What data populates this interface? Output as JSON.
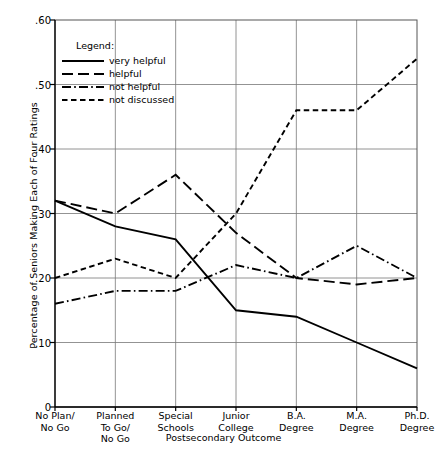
{
  "chart_data": {
    "type": "line",
    "title": "",
    "xlabel": "Postsecondary Outcome",
    "ylabel": "Percentage of Seniors Making Each of Four Ratings",
    "categories": [
      "No Plan/\nNo Go",
      "Planned\nTo Go/\nNo Go",
      "Special\nSchools",
      "Junior\nCollege",
      "B.A.\nDegree",
      "M.A.\nDegree",
      "Ph.D.\nDegree"
    ],
    "ylim": [
      0,
      0.6
    ],
    "ytick_values": [
      0,
      0.1,
      0.2,
      0.3,
      0.4,
      0.5,
      0.6
    ],
    "ytick_labels": [
      "0",
      ".10",
      ".20",
      ".30",
      ".40",
      ".50",
      ".60"
    ],
    "grid": true,
    "legend_position": "upper-left-inside",
    "legend_title": "Legend:",
    "series": [
      {
        "name": "very helpful",
        "style": "solid",
        "color": "#000000",
        "values": [
          0.32,
          0.28,
          0.26,
          0.15,
          0.14,
          0.1,
          0.06
        ]
      },
      {
        "name": "helpful",
        "style": "long-dash",
        "color": "#000000",
        "values": [
          0.32,
          0.3,
          0.36,
          0.27,
          0.2,
          0.19,
          0.2
        ]
      },
      {
        "name": "not helpful",
        "style": "dash-dot",
        "color": "#000000",
        "values": [
          0.16,
          0.18,
          0.18,
          0.22,
          0.2,
          0.25,
          0.2
        ]
      },
      {
        "name": "not discussed",
        "style": "short-dash",
        "color": "#000000",
        "values": [
          0.2,
          0.23,
          0.2,
          0.3,
          0.46,
          0.46,
          0.54
        ]
      }
    ]
  },
  "xticks": [
    {
      "lines": [
        "No Plan/",
        "No Go"
      ]
    },
    {
      "lines": [
        "Planned",
        "To Go/",
        "No Go"
      ]
    },
    {
      "lines": [
        "Special",
        "Schools"
      ]
    },
    {
      "lines": [
        "Junior",
        "College"
      ]
    },
    {
      "lines": [
        "B.A.",
        "Degree"
      ]
    },
    {
      "lines": [
        "M.A.",
        "Degree"
      ]
    },
    {
      "lines": [
        "Ph.D.",
        "Degree"
      ]
    }
  ],
  "axes": {
    "ylabel": "Percentage of Seniors Making Each of Four Ratings",
    "xlabel": "Postsecondary Outcome"
  },
  "legend": {
    "title": "Legend:",
    "entries": [
      {
        "label": "very helpful",
        "style": "solid"
      },
      {
        "label": "helpful",
        "style": "long-dash"
      },
      {
        "label": "not helpful",
        "style": "dash-dot"
      },
      {
        "label": "not discussed",
        "style": "short-dash"
      }
    ]
  }
}
